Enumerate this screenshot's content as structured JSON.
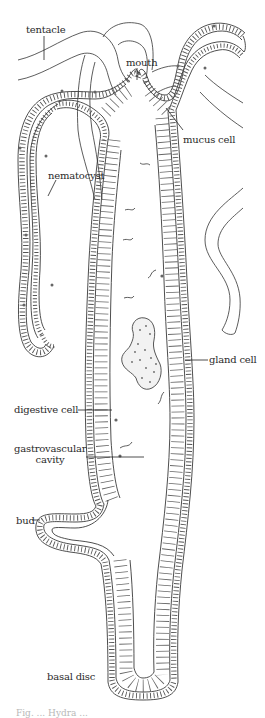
{
  "figure": {
    "caption_partial": "Fig. ... Hydra ..."
  },
  "labels": [
    {
      "id": "tentacle",
      "text": "tentacle",
      "x": 26,
      "y": 24,
      "leader": [
        [
          44,
          36
        ],
        [
          44,
          60
        ]
      ]
    },
    {
      "id": "mouth",
      "text": "mouth",
      "x": 126,
      "y": 57,
      "leader": [
        [
          137,
          68
        ],
        [
          137,
          80
        ]
      ]
    },
    {
      "id": "mucus-cell",
      "text": "mucus cell",
      "x": 183,
      "y": 134,
      "leader": [
        [
          168,
          110
        ],
        [
          183,
          130
        ]
      ]
    },
    {
      "id": "nematocyst",
      "text": "nematocyst",
      "x": 48,
      "y": 170,
      "leader": [
        [
          56,
          180
        ],
        [
          48,
          196
        ]
      ]
    },
    {
      "id": "gland-cell",
      "text": "gland cell",
      "x": 209,
      "y": 354,
      "leader": [
        [
          185,
          360
        ],
        [
          208,
          360
        ]
      ]
    },
    {
      "id": "digestive-cell",
      "text": "digestive cell",
      "x": 14,
      "y": 404,
      "leader": [
        [
          78,
          410
        ],
        [
          110,
          410
        ]
      ]
    },
    {
      "id": "gastrovascular-cavity",
      "text": "gastrovascular\ncavity",
      "x": 14,
      "y": 443,
      "leader": [
        [
          86,
          457
        ],
        [
          144,
          457
        ]
      ]
    },
    {
      "id": "bud",
      "text": "bud",
      "x": 16,
      "y": 515,
      "leader": [
        [
          32,
          520
        ],
        [
          42,
          520
        ]
      ]
    },
    {
      "id": "basal-disc",
      "text": "basal disc",
      "x": 47,
      "y": 671,
      "leader": []
    }
  ],
  "colors": {
    "ink": "#333333",
    "background": "#ffffff",
    "caption": "#b8b8b8"
  }
}
